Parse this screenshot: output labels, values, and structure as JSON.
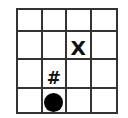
{
  "board": {
    "rows": 4,
    "cols": 4,
    "cells": [
      [
        "",
        "",
        "",
        ""
      ],
      [
        "",
        "",
        "X",
        ""
      ],
      [
        "",
        "#",
        "",
        ""
      ],
      [
        "",
        "circle",
        "",
        ""
      ]
    ]
  },
  "pieces": {
    "x_mark": "X",
    "hash_mark": "#",
    "player": "filled-circle"
  },
  "colors": {
    "grid_line": "#333333",
    "mark": "#111111",
    "player": "#000000",
    "background": "#ffffff"
  }
}
